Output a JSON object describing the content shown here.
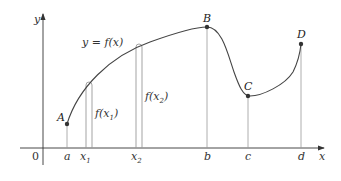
{
  "diagram": {
    "axes": {
      "x_label": "x",
      "y_label": "y",
      "origin_label": "0"
    },
    "curve_label": "y = f(x)",
    "points": [
      {
        "name": "A",
        "x_tick": "a"
      },
      {
        "name": "B",
        "x_tick": "b"
      },
      {
        "name": "C",
        "x_tick": "c"
      },
      {
        "name": "D",
        "x_tick": "d"
      }
    ],
    "sample_points": [
      {
        "tick_main": "x",
        "tick_sub": "1",
        "height_label_main": "f(x",
        "height_label_sub": "1",
        "height_label_close": ")"
      },
      {
        "tick_main": "x",
        "tick_sub": "2",
        "height_label_main": "f(x",
        "height_label_sub": "2",
        "height_label_close": ")"
      }
    ],
    "colors": {
      "axis": "#333333",
      "curve": "#444444",
      "guide_lines": "#999999",
      "points": "#333333"
    }
  }
}
